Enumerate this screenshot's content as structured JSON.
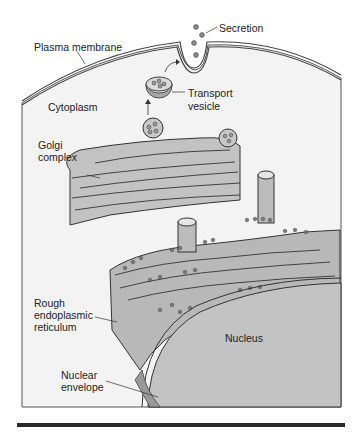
{
  "diagram": {
    "type": "cell secretory pathway illustration",
    "labels": {
      "secretion": "Secretion",
      "plasma_membrane": "Plasma membrane",
      "transport_vesicle_1": "Transport",
      "transport_vesicle_2": "vesicle",
      "cytoplasm": "Cytoplasm",
      "golgi_1": "Golgi",
      "golgi_2": "complex",
      "rer_1": "Rough",
      "rer_2": "endoplasmic",
      "rer_3": "reticulum",
      "nucleus": "Nucleus",
      "nuclear_envelope_1": "Nuclear",
      "nuclear_envelope_2": "envelope"
    },
    "colors": {
      "cytoplasm": "#f2f2f2",
      "organelle_fill": "#bdbdbd",
      "organelle_dark": "#9a9a9a",
      "nucleus": "#c4c4c4",
      "outline": "#333333",
      "footer_bar": "#2a2a2a"
    }
  }
}
